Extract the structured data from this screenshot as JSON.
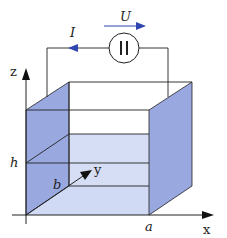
{
  "diagram": {
    "labels": {
      "voltage": "U",
      "current": "I",
      "voltmeter_symbol": "||",
      "z_axis": "z",
      "x_axis": "x",
      "y_axis": "y",
      "height": "h",
      "depth": "b",
      "width": "a"
    },
    "colors": {
      "plate_fill": "#9aa8e0",
      "floor_fill": "#cfd9f4",
      "arrow_blue": "#2f45b0",
      "line": "#222222"
    }
  }
}
